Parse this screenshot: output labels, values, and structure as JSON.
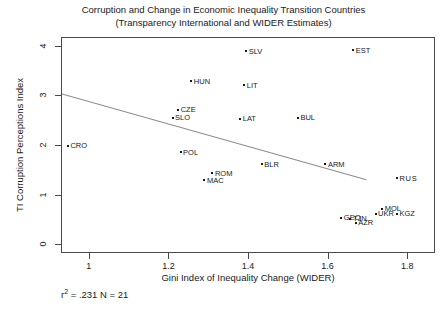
{
  "chart_data": {
    "type": "scatter",
    "title_lines": [
      "Corruption and Change in Economic Inequality Transition Countries",
      "(Transparency International and WIDER Estimates)"
    ],
    "title": "Corruption and Change in Economic Inequality Transition Countries (Transparency International and WIDER Estimates)",
    "xlabel": "Gini Index of Inequality Change (WIDER)",
    "ylabel": "TI Corruption Perceptions Index",
    "xlim": [
      0.93,
      1.87
    ],
    "ylim": [
      -0.18,
      4.18
    ],
    "xticks": [
      1,
      1.2,
      1.4,
      1.6,
      1.8
    ],
    "xtick_labels": [
      "1",
      "1.2",
      "1.4",
      "1.6",
      "1.8"
    ],
    "yticks": [
      0,
      1,
      2,
      3,
      4
    ],
    "ytick_labels": [
      "0",
      "1",
      "2",
      "3",
      "4"
    ],
    "grid": false,
    "legend": false,
    "marker": "small-square-dot",
    "point_label_position": "right-of-marker",
    "annotation": "r2 = .231 N = 21",
    "annotation_parts": {
      "r": "r",
      "exponent": "2",
      "rest": " = .231 N = 21"
    },
    "r_squared": 0.231,
    "n": 21,
    "trendline": {
      "type": "linear",
      "x_start": 0.93,
      "y_start": 3.05,
      "x_end": 1.695,
      "y_end": 1.32,
      "color": "#8c8c8c"
    },
    "points": [
      {
        "label": "SLV",
        "x": 1.393,
        "y": 3.9
      },
      {
        "label": "EST",
        "x": 1.662,
        "y": 3.92
      },
      {
        "label": "HUN",
        "x": 1.255,
        "y": 3.3
      },
      {
        "label": "LIT",
        "x": 1.388,
        "y": 3.22
      },
      {
        "label": "CZE",
        "x": 1.222,
        "y": 2.72
      },
      {
        "label": "SLO",
        "x": 1.208,
        "y": 2.56
      },
      {
        "label": "LAT",
        "x": 1.378,
        "y": 2.54
      },
      {
        "label": "BUL",
        "x": 1.523,
        "y": 2.56
      },
      {
        "label": "CRO",
        "x": 0.945,
        "y": 2.0
      },
      {
        "label": "POL",
        "x": 1.228,
        "y": 1.86
      },
      {
        "label": "BLR",
        "x": 1.432,
        "y": 1.62
      },
      {
        "label": "ARM",
        "x": 1.592,
        "y": 1.62
      },
      {
        "label": "ROM",
        "x": 1.308,
        "y": 1.44
      },
      {
        "label": "MAC",
        "x": 1.288,
        "y": 1.3
      },
      {
        "label": "RUS",
        "x": 1.772,
        "y": 1.34
      },
      {
        "label": "MOL",
        "x": 1.735,
        "y": 0.72
      },
      {
        "label": "UKR",
        "x": 1.718,
        "y": 0.62
      },
      {
        "label": "KGZ",
        "x": 1.772,
        "y": 0.62
      },
      {
        "label": "GEO",
        "x": 1.632,
        "y": 0.54
      },
      {
        "label": "TJN",
        "x": 1.655,
        "y": 0.52
      },
      {
        "label": "AZR",
        "x": 1.668,
        "y": 0.44
      }
    ]
  }
}
